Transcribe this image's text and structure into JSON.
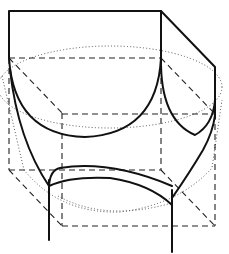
{
  "figure": {
    "line_styles": {
      "visible_edge": "solid",
      "hidden_edge": "dashed",
      "construction": "dotted"
    },
    "colors": {
      "background": "#ffffff",
      "ink": "#111111"
    }
  }
}
